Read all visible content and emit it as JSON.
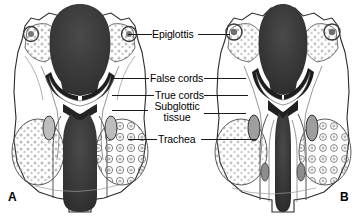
{
  "figure": {
    "type": "anatomical-illustration",
    "background_color": "#ffffff",
    "line_color": "#1a1a1a",
    "lumen_color": "#3a3a3a",
    "tissue_fill": "#ffffff",
    "stipple_color": "#8a8a8a"
  },
  "labels": [
    {
      "id": "epiglottis",
      "text": "Epiglottis",
      "x": 152,
      "y": 29
    },
    {
      "id": "false-cords",
      "text": "False cords",
      "x": 150,
      "y": 73
    },
    {
      "id": "true-cords",
      "text": "True cords",
      "x": 155,
      "y": 90
    },
    {
      "id": "subglottic-tissue",
      "line1": "Subglottic",
      "line2": "tissue",
      "x": 149,
      "y": 101
    },
    {
      "id": "trachea",
      "text": "Trachea",
      "x": 158,
      "y": 134
    }
  ],
  "panels": [
    {
      "id": "a",
      "letter": "A",
      "letter_x": 8,
      "letter_y": 195
    },
    {
      "id": "b",
      "letter": "B",
      "letter_x": 340,
      "letter_y": 195
    }
  ],
  "credit": {
    "text": ""
  }
}
